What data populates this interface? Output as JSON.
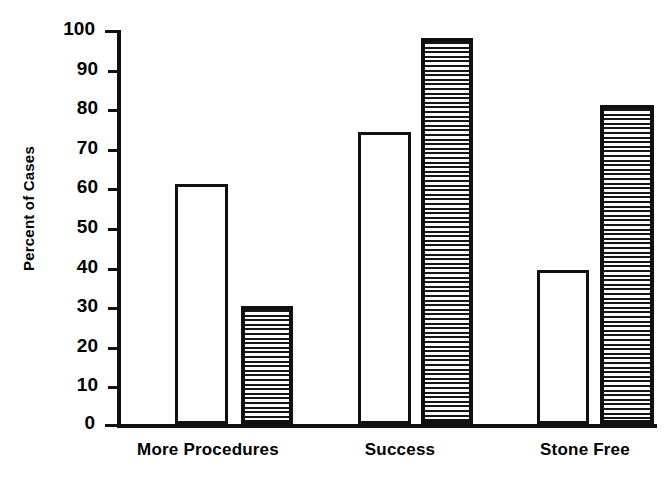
{
  "chart_data": {
    "type": "bar",
    "title": "",
    "xlabel": "",
    "ylabel": "Percent of Cases",
    "ylim": [
      0,
      100
    ],
    "yticks": [
      0,
      10,
      20,
      30,
      40,
      50,
      60,
      70,
      80,
      90,
      100
    ],
    "ytick_labels": [
      "0",
      "10",
      "20",
      "30",
      "40",
      "50",
      "60",
      "70",
      "80",
      "90",
      "100"
    ],
    "grid": false,
    "legend": "none",
    "categories": [
      "More Procedures",
      "Success",
      "Stone Free"
    ],
    "series": [
      {
        "name": "open",
        "style": "white-open-bar",
        "values": [
          61,
          74,
          39
        ]
      },
      {
        "name": "hatched",
        "style": "horizontal-hatch-bar",
        "values": [
          30,
          98,
          81
        ]
      }
    ],
    "bars": [
      {
        "category": "More Procedures",
        "series": "open",
        "value": 61
      },
      {
        "category": "More Procedures",
        "series": "hatched",
        "value": 30
      },
      {
        "category": "Success",
        "series": "open",
        "value": 74
      },
      {
        "category": "Success",
        "series": "hatched",
        "value": 98
      },
      {
        "category": "Stone Free",
        "series": "open",
        "value": 39
      },
      {
        "category": "Stone Free",
        "series": "hatched",
        "value": 81
      }
    ],
    "colors": {
      "axis": "#111111",
      "open_bar_fill": "#ffffff",
      "open_bar_edge": "#111111",
      "hatch_line": "#161616",
      "hatch_background": "#fbfbfb",
      "background": "#ffffff"
    }
  }
}
